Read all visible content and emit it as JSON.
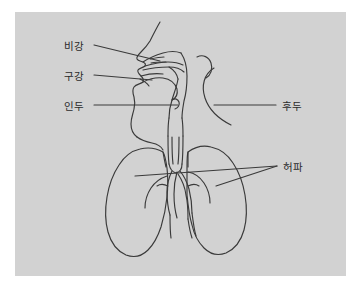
{
  "diagram": {
    "background_color": "#ffffff",
    "panel_color": "#d2d2d2",
    "stroke_color": "#3a3a3a",
    "label_color": "#2b2b2b",
    "leader_color": "#3a3a3a",
    "labels": [
      {
        "id": "nasal-cavity",
        "text": "비강",
        "english": "nasal cavity",
        "side": "left",
        "x": 64,
        "y": 41
      },
      {
        "id": "oral-cavity",
        "text": "구강",
        "english": "oral cavity",
        "side": "left",
        "x": 64,
        "y": 71
      },
      {
        "id": "pharynx",
        "text": "인두",
        "english": "pharynx",
        "side": "left",
        "x": 64,
        "y": 101
      },
      {
        "id": "larynx",
        "text": "후두",
        "english": "larynx",
        "side": "right",
        "x": 282,
        "y": 101
      },
      {
        "id": "lungs",
        "text": "허파",
        "english": "lungs",
        "side": "right",
        "x": 283,
        "y": 162
      }
    ],
    "parts": [
      "head-profile",
      "nasal-cavity",
      "oral-cavity",
      "tongue",
      "pharynx",
      "larynx",
      "trachea",
      "bronchi",
      "left-lung",
      "right-lung"
    ]
  }
}
